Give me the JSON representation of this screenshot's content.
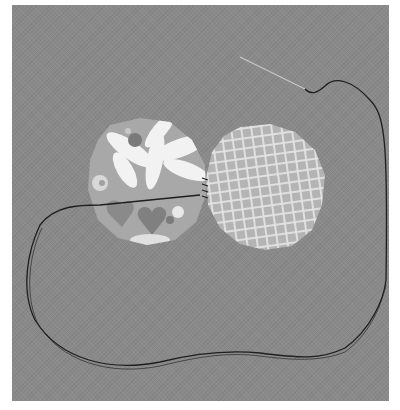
{
  "image": {
    "subject": "two fabric-covered circles joined by stitches, with needle and dark thread on gray fabric background",
    "colors": {
      "background": "#8a8a8a",
      "floral_base": "#a8a8a8",
      "floral_petals": "#f2f2f2",
      "floral_accents": "#7a7a7a",
      "gingham_base": "#b4b4b4",
      "gingham_lines": "#e6e6e6",
      "thread": "#1e1e1e",
      "needle": "#c8c8c8"
    },
    "objects": [
      {
        "name": "floral fabric circle",
        "cx": 150,
        "cy": 182,
        "r": 63
      },
      {
        "name": "gingham fabric circle",
        "cx": 264,
        "cy": 187,
        "r": 63
      },
      {
        "name": "needle"
      },
      {
        "name": "thread"
      }
    ]
  }
}
